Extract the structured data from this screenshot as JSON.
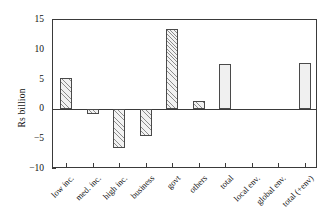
{
  "chart_data": {
    "type": "bar",
    "title": "",
    "xlabel": "",
    "ylabel": "Rs billion",
    "ylim": [
      -10,
      15
    ],
    "yticks": [
      15,
      10,
      5,
      0,
      -5,
      -10
    ],
    "ytick_labels": [
      "15",
      "10",
      "5",
      "0",
      "−5",
      "−10"
    ],
    "grid": false,
    "legend": "none",
    "categories": [
      "low inc.",
      "med. inc.",
      "high inc.",
      "business",
      "govt",
      "others",
      "total",
      "local env.",
      "global env.",
      "total (+env)"
    ],
    "values": [
      5.3,
      -0.8,
      -6.5,
      -4.5,
      13.5,
      1.4,
      7.7,
      0,
      0,
      7.8
    ],
    "bar_styles": [
      "hatched",
      "hatched",
      "hatched",
      "hatched",
      "hatched",
      "hatched",
      "solid",
      "none",
      "none",
      "solid"
    ],
    "units": "Rs billion"
  },
  "colors": {
    "axis": "#3a3a3a",
    "bar_edge": "#4a4a4a",
    "hatch_line": "#8c8c8c",
    "bar_solid_fill": "#f0f0f0",
    "background": "#ffffff"
  }
}
